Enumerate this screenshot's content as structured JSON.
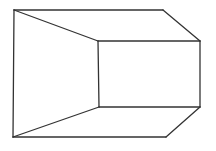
{
  "diagram": {
    "type": "line-drawing",
    "stroke_color": "#333333",
    "background": "#ffffff",
    "stroke_width": 1.3,
    "vertices": {
      "outer_top_left": [
        14,
        10
      ],
      "outer_top_right": [
        163,
        10
      ],
      "right_top": [
        200,
        41
      ],
      "right_bottom": [
        200,
        107
      ],
      "outer_bottom_right": [
        166,
        137
      ],
      "outer_bottom_left": [
        13,
        137
      ],
      "inner_top_left": [
        98,
        41
      ],
      "inner_bottom_left": [
        99,
        107
      ]
    },
    "edges": [
      [
        "outer_top_left",
        "outer_top_right"
      ],
      [
        "outer_top_right",
        "right_top"
      ],
      [
        "right_top",
        "right_bottom"
      ],
      [
        "right_bottom",
        "outer_bottom_right"
      ],
      [
        "outer_bottom_right",
        "outer_bottom_left"
      ],
      [
        "outer_bottom_left",
        "outer_top_left"
      ],
      [
        "outer_top_left",
        "inner_top_left"
      ],
      [
        "inner_top_left",
        "right_top"
      ],
      [
        "inner_top_left",
        "inner_bottom_left"
      ],
      [
        "inner_bottom_left",
        "right_bottom"
      ],
      [
        "outer_bottom_left",
        "inner_bottom_left"
      ]
    ]
  }
}
